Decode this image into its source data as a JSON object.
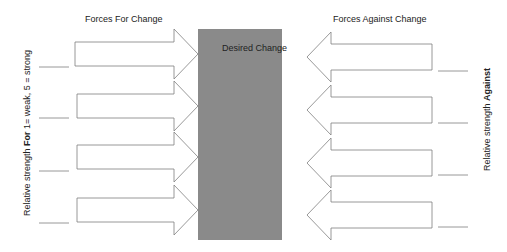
{
  "diagram": {
    "title_for": "Forces For Change",
    "title_against": "Forces Against Change",
    "center_label": "Desired Change",
    "left_axis_label_pre": "Relative strength ",
    "left_axis_label_bold": "For",
    "left_axis_label_post": " 1= weak, 5 = strong",
    "right_axis_label_pre": "Relative strength ",
    "right_axis_label_bold": "Against",
    "center_color": "#8a8a8a",
    "arrow_stroke": "#7f7f7f",
    "forces_for": [
      {
        "text": "",
        "strength": ""
      },
      {
        "text": "",
        "strength": ""
      },
      {
        "text": "",
        "strength": ""
      },
      {
        "text": "",
        "strength": ""
      }
    ],
    "forces_against": [
      {
        "text": "",
        "strength": ""
      },
      {
        "text": "",
        "strength": ""
      },
      {
        "text": "",
        "strength": ""
      },
      {
        "text": "",
        "strength": ""
      }
    ]
  }
}
